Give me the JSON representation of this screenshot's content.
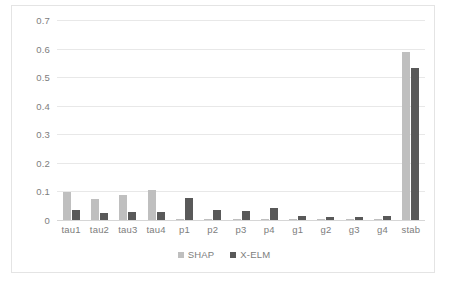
{
  "chart_data": {
    "type": "bar",
    "title": "",
    "xlabel": "",
    "ylabel": "",
    "ylim": [
      0,
      0.7
    ],
    "grid": true,
    "legend_position": "bottom",
    "yticks": [
      "0.7",
      "0.6",
      "0.5",
      "0.4",
      "0.3",
      "0.2",
      "0.1",
      "0"
    ],
    "ytick_values": [
      0.7,
      0.6,
      0.5,
      0.4,
      0.3,
      0.2,
      0.1,
      0
    ],
    "categories": [
      "tau1",
      "tau2",
      "tau3",
      "tau4",
      "p1",
      "p2",
      "p3",
      "p4",
      "g1",
      "g2",
      "g3",
      "g4",
      "stab"
    ],
    "series": [
      {
        "name": "SHAP",
        "color": "#bfbfbf",
        "values": [
          0.098,
          0.075,
          0.088,
          0.106,
          0.002,
          0.002,
          0.002,
          0.003,
          0.001,
          0.001,
          0.002,
          0.002,
          0.588
        ]
      },
      {
        "name": "X-ELM",
        "color": "#595959",
        "values": [
          0.036,
          0.026,
          0.028,
          0.028,
          0.077,
          0.036,
          0.033,
          0.042,
          0.014,
          0.011,
          0.011,
          0.013,
          0.531
        ]
      }
    ]
  },
  "legend": {
    "items": [
      {
        "label": "SHAP"
      },
      {
        "label": "X-ELM"
      }
    ]
  }
}
